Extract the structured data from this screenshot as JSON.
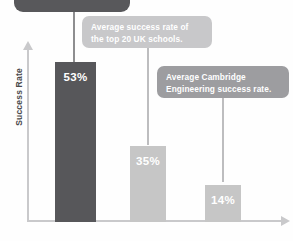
{
  "chart_data": {
    "type": "bar",
    "title": "",
    "xlabel": "",
    "ylabel": "Success Rate",
    "categories": [
      "",
      "",
      ""
    ],
    "values": [
      53,
      35,
      14
    ],
    "value_labels": [
      "53%",
      "35%",
      "14%"
    ],
    "ylim": [
      0,
      60
    ],
    "grid": false,
    "legend": "none",
    "series": [
      {
        "name": "Success Rate",
        "values": [
          53,
          35,
          14
        ],
        "colors": [
          "#57575a",
          "#c6c6c6",
          "#c6c6c6"
        ]
      }
    ],
    "annotations": [
      {
        "text": "",
        "target_index": 0,
        "color": "#58585b",
        "note": "top dark callout, text cropped off above image edge"
      },
      {
        "text": "Average success rate of the top 20 UK schools.",
        "target_index": 1,
        "color": "#c8c8ca"
      },
      {
        "text": "Average Cambridge Engineering success rate.",
        "target_index": 2,
        "color": "#9d9da0"
      }
    ]
  },
  "axes": {
    "y_title": "Success Rate",
    "x_title": ""
  },
  "bars": [
    {
      "value_label": "53%",
      "value": 53,
      "color": "#57575a"
    },
    {
      "value_label": "35%",
      "value": 35,
      "color": "#c6c6c6"
    },
    {
      "value_label": "14%",
      "value": 14,
      "color": "#c6c6c6"
    }
  ],
  "callouts": [
    {
      "line1": "",
      "line2": ""
    },
    {
      "line1": "Average success rate of",
      "line2": "the top 20 UK schools."
    },
    {
      "line1": "Average Cambridge",
      "line2": "Engineering success rate."
    }
  ],
  "colors": {
    "bar_primary": "#57575a",
    "bar_secondary": "#c6c6c6",
    "axis": "#c9c9cb",
    "callout_dark": "#58585b",
    "callout_light": "#c8c8ca",
    "callout_medium": "#9d9da0"
  }
}
